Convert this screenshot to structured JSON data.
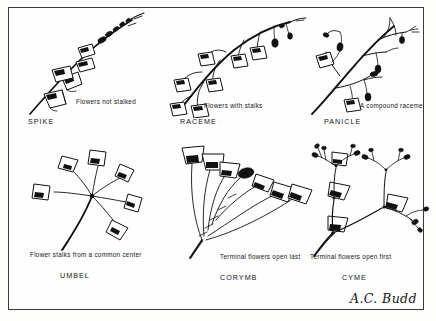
{
  "plate": {
    "signature": "A.C. Budd",
    "background_color": "#fdfdfc",
    "ink_color": "#111111",
    "border_color": "#3a3a3a"
  },
  "panels": [
    {
      "id": "spike",
      "title": "SPIKE",
      "caption": "Flowers not stalked",
      "icon": "spike-inflorescence-icon"
    },
    {
      "id": "raceme",
      "title": "RACEME",
      "caption": "Flowers with stalks",
      "icon": "raceme-inflorescence-icon"
    },
    {
      "id": "panicle",
      "title": "PANICLE",
      "caption": "A compound raceme",
      "icon": "panicle-inflorescence-icon"
    },
    {
      "id": "umbel",
      "title": "UMBEL",
      "caption": "Flower stalks from a common center",
      "icon": "umbel-inflorescence-icon"
    },
    {
      "id": "corymb",
      "title": "CORYMB",
      "caption": "Terminal flowers open last",
      "icon": "corymb-inflorescence-icon"
    },
    {
      "id": "cyme",
      "title": "CYME",
      "caption": "Terminal flowers open first",
      "icon": "cyme-inflorescence-icon"
    }
  ]
}
